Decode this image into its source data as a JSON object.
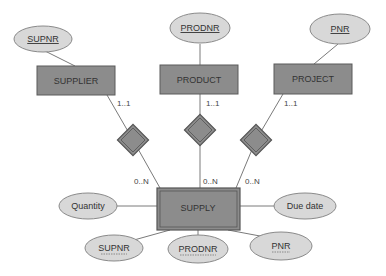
{
  "colors": {
    "entity_fill": "#8c8c8c",
    "entity_stroke": "#5a5a5a",
    "attribute_fill": "#d8d8d8",
    "attribute_stroke": "#8a8a8a",
    "line": "#7a7a7a",
    "text": "#333333"
  },
  "entities": {
    "supplier": "SUPPLIER",
    "product": "PRODUCT",
    "project": "PROJECT",
    "supply": "SUPPLY"
  },
  "attributes": {
    "supplier_key": "SUPNR",
    "product_key": "PRODNR",
    "project_key": "PNR",
    "quantity": "Quantity",
    "due_date": "Due date",
    "supply_supnr": "SUPNR",
    "supply_prodnr": "PRODNR",
    "supply_pnr": "PNR"
  },
  "cardinalities": {
    "supplier_side": "1..1",
    "product_side": "1..1",
    "project_side": "1..1",
    "supply_supplier": "0..N",
    "supply_product": "0..N",
    "supply_project": "0..N"
  }
}
